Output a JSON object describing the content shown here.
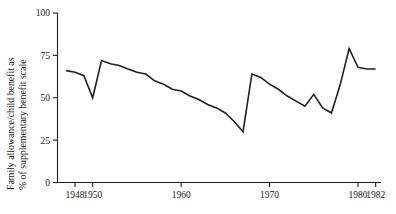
{
  "chart_data": {
    "type": "line",
    "title": "",
    "xlabel": "",
    "ylabel": "Family allowance/child benefit as % of supplementary benefit scale",
    "ylabel_line1": "Family allowance/child benefit as",
    "ylabel_line2": "% of supplementary benefit scale",
    "xlim": [
      1947,
      1982
    ],
    "ylim": [
      0,
      100
    ],
    "grid": false,
    "legend": null,
    "yticks": [
      0,
      25,
      50,
      75,
      100
    ],
    "ytick_labels": [
      "0",
      "25",
      "50",
      "75",
      "100"
    ],
    "xticks": [
      1948,
      1950,
      1960,
      1970,
      1980,
      1982
    ],
    "xtick_labels": [
      "1948",
      "1950",
      "1960",
      "1970",
      "1980",
      "1982"
    ],
    "x": [
      1947,
      1948,
      1949,
      1950,
      1951,
      1952,
      1953,
      1954,
      1955,
      1956,
      1957,
      1958,
      1959,
      1960,
      1961,
      1962,
      1963,
      1964,
      1965,
      1966,
      1967,
      1968,
      1969,
      1970,
      1971,
      1972,
      1973,
      1974,
      1975,
      1976,
      1977,
      1978,
      1979,
      1980,
      1981,
      1982
    ],
    "values": [
      66,
      65,
      63,
      50,
      72,
      70,
      69,
      67,
      65,
      64,
      60,
      58,
      55,
      54,
      51,
      49,
      46,
      44,
      41,
      36,
      30,
      64,
      62,
      58,
      55,
      51,
      48,
      45,
      52,
      44,
      41,
      58,
      79,
      68,
      67,
      67
    ],
    "series_color": "#231f20",
    "line_width": 1.6
  },
  "axis": {
    "y_axis_name": "y-axis",
    "x_axis_name": "x-axis"
  }
}
